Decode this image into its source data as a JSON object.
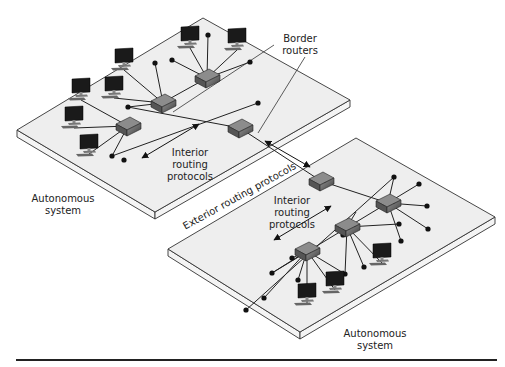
{
  "labels": {
    "border_routers": [
      "Border",
      "routers"
    ],
    "interior_top": [
      "Interior",
      "routing",
      "protocols"
    ],
    "interior_bottom": [
      "Interior",
      "routing",
      "protocols"
    ],
    "as_top": [
      "Autonomous",
      "system"
    ],
    "as_bottom": [
      "Autonomous",
      "system"
    ],
    "exterior": "Exterior routing protocols"
  },
  "colors": {
    "platform_top": "#eeeeee",
    "platform_side": "#f4f4f4",
    "stroke": "#333333",
    "router": "#555555",
    "monitor": "#1a1a1a"
  },
  "platforms": [
    {
      "name": "autonomous-system-top",
      "top": [
        [
          203,
          18
        ],
        [
          350,
          100
        ],
        [
          155,
          212
        ],
        [
          17,
          130
        ]
      ],
      "thick": 7
    },
    {
      "name": "autonomous-system-bottom",
      "top": [
        [
          356,
          138
        ],
        [
          495,
          217
        ],
        [
          300,
          332
        ],
        [
          168,
          249
        ]
      ],
      "thick": 7
    }
  ],
  "routers": [
    {
      "name": "router-top-1",
      "x": 207,
      "y": 78
    },
    {
      "name": "router-top-2",
      "x": 163,
      "y": 103
    },
    {
      "name": "router-top-3",
      "x": 128,
      "y": 126
    },
    {
      "name": "border-router-top",
      "x": 240,
      "y": 128
    },
    {
      "name": "border-router-bottom",
      "x": 321,
      "y": 181
    },
    {
      "name": "router-bottom-1",
      "x": 388,
      "y": 203
    },
    {
      "name": "router-bottom-2",
      "x": 347,
      "y": 227
    },
    {
      "name": "router-bottom-3",
      "x": 307,
      "y": 251
    }
  ],
  "computers": [
    {
      "x": 190,
      "y": 38
    },
    {
      "x": 237,
      "y": 40
    },
    {
      "x": 124,
      "y": 60
    },
    {
      "x": 81,
      "y": 90
    },
    {
      "x": 114,
      "y": 88
    },
    {
      "x": 74,
      "y": 118
    },
    {
      "x": 89,
      "y": 146
    },
    {
      "x": 382,
      "y": 255
    },
    {
      "x": 335,
      "y": 283
    },
    {
      "x": 307,
      "y": 295
    }
  ],
  "nodes": [
    [
      208,
      35
    ],
    [
      172,
      60
    ],
    [
      250,
      62
    ],
    [
      258,
      103
    ],
    [
      155,
      63
    ],
    [
      128,
      107
    ],
    [
      112,
      156
    ],
    [
      124,
      160
    ],
    [
      394,
      177
    ],
    [
      419,
      184
    ],
    [
      427,
      206
    ],
    [
      428,
      229
    ],
    [
      401,
      241
    ],
    [
      399,
      224
    ],
    [
      292,
      258
    ],
    [
      343,
      235
    ],
    [
      364,
      267
    ],
    [
      345,
      274
    ],
    [
      298,
      280
    ],
    [
      264,
      298
    ],
    [
      272,
      273
    ],
    [
      246,
      310
    ]
  ]
}
